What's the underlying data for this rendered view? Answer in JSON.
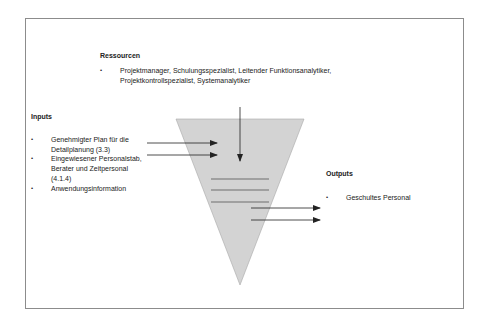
{
  "diagram": {
    "colors": {
      "triangle_fill": "#d3d3d3",
      "triangle_stroke": "#a8a8a8",
      "arrow": "#222222",
      "frame": "#8c8c8c"
    },
    "resources": {
      "heading": "Ressourcen",
      "items": [
        "Projektmanager, Schulungsspezialist, Leitender Funktionsanalytiker, Projektkontrollspezialist, Systemanalytiker"
      ]
    },
    "inputs": {
      "heading": "Inputs",
      "items": [
        "Genehmigter Plan für die Detailplanung (3.3)",
        "Eingewiesener Personalstab, Berater und Zeitpersonal (4.1.4)",
        "Anwendungsinformation"
      ]
    },
    "outputs": {
      "heading": "Outputs",
      "items": [
        "Geschultes Personal"
      ]
    }
  }
}
